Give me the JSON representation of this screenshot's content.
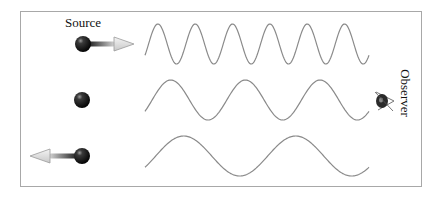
{
  "diagram": {
    "labels": {
      "source": "Source",
      "observer": "Observer"
    },
    "rows": [
      {
        "name": "source-approaching",
        "motion": "toward observer",
        "arrow": "right",
        "cycles": 6,
        "center_y": 44
      },
      {
        "name": "source-stationary",
        "motion": "stationary",
        "arrow": "none",
        "cycles": 3,
        "center_y": 100
      },
      {
        "name": "source-receding",
        "motion": "away from observer",
        "arrow": "left",
        "cycles": 2,
        "center_y": 156
      }
    ],
    "wave": {
      "x_start": 145,
      "x_end": 369,
      "amplitude": 20,
      "stroke": "#8a8a8a"
    },
    "colors": {
      "frame": "#a8a8a8",
      "ball": "#1a1a1a",
      "arrow_fill": "#e8e8e8"
    },
    "icons": {
      "observer": "eye-icon",
      "source": "sphere-icon"
    }
  }
}
